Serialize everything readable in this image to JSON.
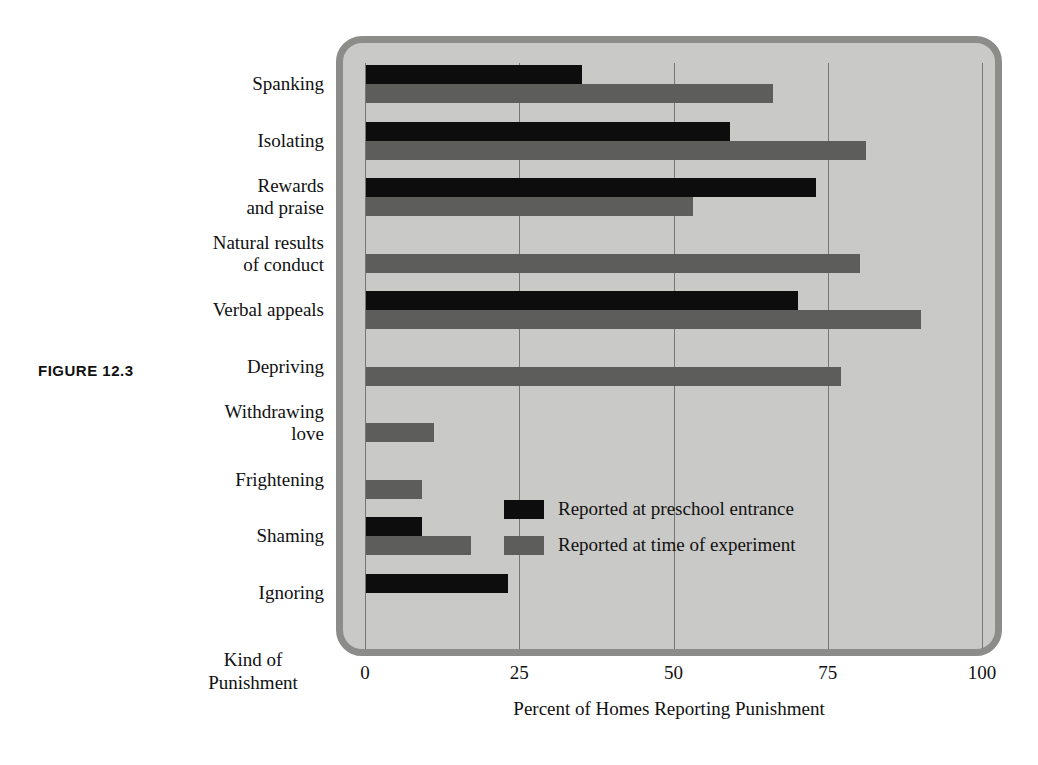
{
  "figure": {
    "label": "FIGURE 12.3"
  },
  "chart_data": {
    "type": "bar",
    "orientation": "horizontal",
    "title": "",
    "xlabel": "Percent of Homes Reporting Punishment",
    "ylabel": "Kind of\nPunishment",
    "xlim": [
      0,
      100
    ],
    "xticks": [
      0,
      25,
      50,
      75,
      100
    ],
    "xtick_labels": [
      "0",
      "25",
      "50",
      "75",
      "100"
    ],
    "grid": "vertical",
    "legend_position": "inside-center-right",
    "categories": [
      "Spanking",
      "Isolating",
      "Rewards\nand praise",
      "Natural results\nof conduct",
      "Verbal appeals",
      "Depriving",
      "Withdrawing\nlove",
      "Frightening",
      "Shaming",
      "Ignoring"
    ],
    "series": [
      {
        "name": "Reported at preschool entrance",
        "color": "#0d0d0d",
        "values": [
          35,
          59,
          73,
          0,
          70,
          0,
          0,
          0,
          9,
          23
        ]
      },
      {
        "name": "Reported at time of experiment",
        "color": "#5d5d5b",
        "values": [
          66,
          81,
          53,
          80,
          90,
          77,
          11,
          9,
          17,
          0
        ]
      }
    ]
  },
  "colors": {
    "plot_background": "#c9c9c7",
    "plot_border": "#8c8c8a",
    "gridline": "#77776f",
    "page_background": "#ffffff",
    "text": "#111111"
  }
}
